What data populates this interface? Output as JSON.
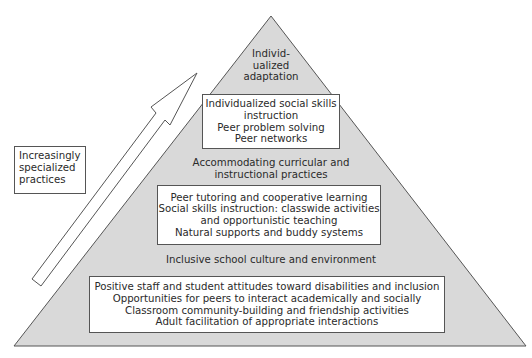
{
  "diagram": {
    "type": "pyramid",
    "colors": {
      "pyramid_fill": "#d9d9d9",
      "outline": "#555555",
      "box_fill": "#ffffff",
      "text": "#2a2a2a"
    },
    "side_label": {
      "lines": [
        "Increasingly",
        "specialized",
        "practices"
      ]
    },
    "arrow": {
      "direction": "up-right",
      "meaning": "increasingly specialized practices"
    },
    "tiers": [
      {
        "title_lines": [
          "Individ-",
          "ualized",
          "adaptation"
        ],
        "box_lines": [
          "Individualized social skills",
          "instruction",
          "Peer problem solving",
          "Peer networks"
        ]
      },
      {
        "title_lines": [
          "Accommodating curricular and",
          "instructional practices"
        ],
        "box_lines": [
          "Peer tutoring and cooperative learning",
          "Social skills instruction: classwide activities",
          "and opportunistic teaching",
          "Natural supports and buddy systems"
        ]
      },
      {
        "title_lines": [
          "Inclusive school culture and environment"
        ],
        "box_lines": [
          "Positive staff and student attitudes toward disabilities and inclusion",
          "Opportunities for peers to interact academically and socially",
          "Classroom community-building and friendship activities",
          "Adult facilitation of appropriate interactions"
        ]
      }
    ]
  }
}
